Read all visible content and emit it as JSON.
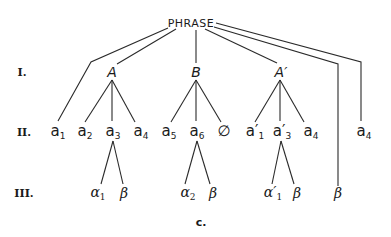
{
  "diagram": {
    "root": "PHRASE",
    "caption": "c.",
    "levels": [
      "I.",
      "II.",
      "III."
    ],
    "level1": [
      {
        "label": "A"
      },
      {
        "label": "B"
      },
      {
        "label": "A′"
      }
    ],
    "level2": [
      {
        "base": "a",
        "sub": "1",
        "parent": "PHRASE"
      },
      {
        "base": "a",
        "sub": "2",
        "parent": "A"
      },
      {
        "base": "a",
        "sub": "3",
        "parent": "A"
      },
      {
        "base": "a",
        "sub": "4",
        "parent": "A"
      },
      {
        "base": "a",
        "sub": "5",
        "parent": "B"
      },
      {
        "base": "a",
        "sub": "6",
        "parent": "B"
      },
      {
        "base": "∅",
        "sub": "",
        "parent": "B"
      },
      {
        "base": "a′",
        "sub": "1",
        "parent": "A′"
      },
      {
        "base": "a′",
        "sub": "3",
        "parent": "A′"
      },
      {
        "base": "a",
        "sub": "4",
        "parent": "A′"
      },
      {
        "base": "a",
        "sub": "4",
        "parent": "PHRASE"
      }
    ],
    "level3": [
      {
        "base": "α",
        "sub": "1",
        "parent": "a3"
      },
      {
        "base": "β",
        "sub": "",
        "parent": "a3"
      },
      {
        "base": "α",
        "sub": "2",
        "parent": "a6"
      },
      {
        "base": "β",
        "sub": "",
        "parent": "a6"
      },
      {
        "base": "α′",
        "sub": "1",
        "parent": "a′3"
      },
      {
        "base": "β",
        "sub": "",
        "parent": "a′3"
      },
      {
        "base": "β",
        "sub": "",
        "parent": "PHRASE"
      }
    ]
  }
}
